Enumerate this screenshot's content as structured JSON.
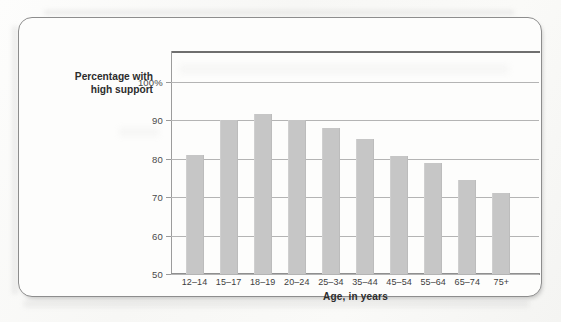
{
  "figure": {
    "border_color": "#8d8d8d",
    "background": "#fdfdfc"
  },
  "chart_data": {
    "type": "bar",
    "title": "",
    "subtitle": "",
    "xlabel": "Age, in years",
    "ylabel": "Percentage with high support",
    "ylabel_lines": [
      "Percentage with",
      "high support"
    ],
    "categories": [
      "12–14",
      "15–17",
      "18–19",
      "20–24",
      "25–34",
      "35–44",
      "45–54",
      "55–64",
      "65–74",
      "75+"
    ],
    "values": [
      81,
      90,
      91.5,
      90,
      88,
      85,
      80.8,
      79,
      74.5,
      71
    ],
    "ylim": [
      50,
      108
    ],
    "yticks": [
      50,
      60,
      70,
      80,
      90,
      100
    ],
    "ytick_labels": [
      "50",
      "60",
      "70",
      "80",
      "90",
      "100%"
    ],
    "grid": true,
    "grid_axis": "y",
    "legend": "none",
    "bar_color": "#c6c6c6",
    "gridline_color": "#b4b4b4",
    "axis_color": "#8f8f8f",
    "units": "percent"
  }
}
